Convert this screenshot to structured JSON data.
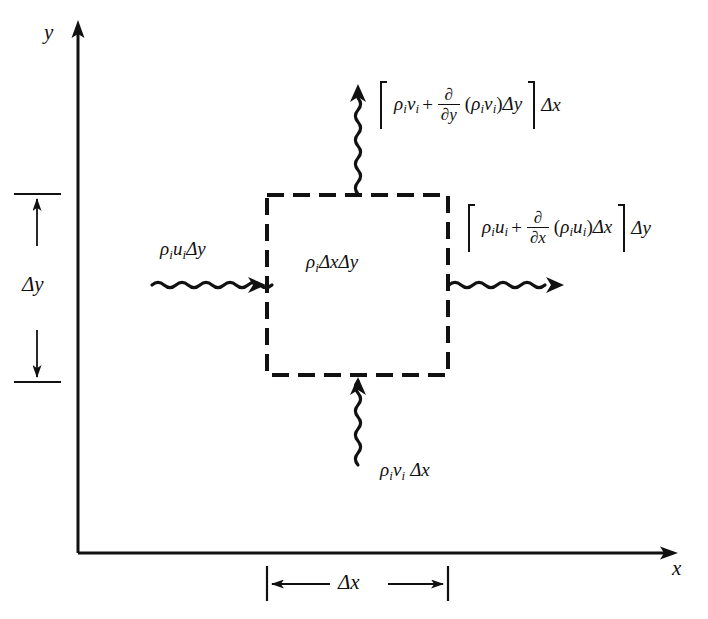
{
  "figure": {
    "background_color": "#ffffff",
    "ink_color": "#111111"
  },
  "axes": {
    "y_label": "y",
    "x_label": "x",
    "origin": {
      "x": 78,
      "y": 553
    },
    "x_axis_end": {
      "x": 678,
      "y": 553
    },
    "y_axis_end": {
      "x": 78,
      "y": 22
    }
  },
  "control_volume": {
    "label": "ρ",
    "label_sub": "i",
    "label_rest": "ΔxΔy",
    "left": 267,
    "top": 195,
    "right": 448,
    "bottom": 375,
    "style": "dashed"
  },
  "dimensions": {
    "delta_y": {
      "label": "Δy",
      "top": 193,
      "bottom": 383
    },
    "delta_x": {
      "label": "Δx",
      "left": 267,
      "right": 448
    }
  },
  "fluxes": {
    "inflow_left": {
      "name": "left-inflow-label",
      "rho": "ρ",
      "sub1": "i",
      "vel": "u",
      "sub2": "i",
      "tail": "Δy",
      "direction": "right"
    },
    "inflow_bottom": {
      "name": "bottom-inflow-label",
      "rho": "ρ",
      "sub1": "i",
      "vel": "v",
      "sub2": "i",
      "tail": "Δx",
      "direction": "up"
    },
    "outflow_top": {
      "name": "top-outflow-label",
      "rho": "ρ",
      "sub1": "i",
      "vel": "v",
      "sub2": "i",
      "plus": "+",
      "deriv_num": "∂",
      "deriv_den": "∂y",
      "open_paren": "(",
      "p_rho": "ρ",
      "p_sub1": "i",
      "p_vel": "v",
      "p_sub2": "i",
      "close_paren": ")",
      "inner_delta": "Δy",
      "outer_delta": "Δx",
      "direction": "up"
    },
    "outflow_right": {
      "name": "right-outflow-label",
      "rho": "ρ",
      "sub1": "i",
      "vel": "u",
      "sub2": "i",
      "plus": "+",
      "deriv_num": "∂",
      "deriv_den": "∂x",
      "open_paren": "(",
      "p_rho": "ρ",
      "p_sub1": "i",
      "p_vel": "u",
      "p_sub2": "i",
      "close_paren": ")",
      "inner_delta": "Δx",
      "outer_delta": "Δy",
      "direction": "right"
    }
  }
}
